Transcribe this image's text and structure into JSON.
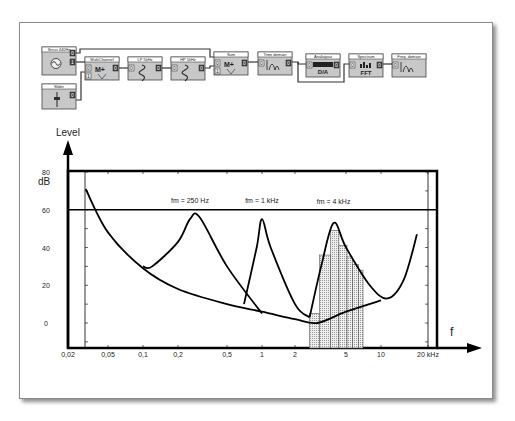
{
  "diagram": {
    "blocks": [
      {
        "id": "sine",
        "title": "Sinus 440Hz",
        "icon": "sine-generator-icon",
        "x": 42,
        "y": 47,
        "w": 34,
        "h": 28
      },
      {
        "id": "slider",
        "title": "Slider",
        "icon": "slider-icon",
        "x": 42,
        "y": 84,
        "w": 34,
        "h": 25
      },
      {
        "id": "multichannel",
        "title": "MultiChannel",
        "icon": "multiplier-icon",
        "x": 85,
        "y": 57,
        "w": 34,
        "h": 23
      },
      {
        "id": "lp",
        "title": "LP 5kHz",
        "icon": "lowpass-filter-icon",
        "x": 128,
        "y": 57,
        "w": 34,
        "h": 23
      },
      {
        "id": "hp",
        "title": "HP 1kHz",
        "icon": "highpass-filter-icon",
        "x": 171,
        "y": 57,
        "w": 34,
        "h": 23
      },
      {
        "id": "sum",
        "title": "Sum",
        "icon": "sum-icon",
        "x": 214,
        "y": 52,
        "w": 34,
        "h": 23
      },
      {
        "id": "time",
        "title": "Time domain",
        "icon": "time-domain-icon",
        "x": 258,
        "y": 52,
        "w": 34,
        "h": 23
      },
      {
        "id": "analog",
        "title": "Analogout",
        "icon": "da-converter-icon",
        "x": 306,
        "y": 54,
        "w": 34,
        "h": 23
      },
      {
        "id": "fft",
        "title": "Spectrum",
        "icon": "fft-icon",
        "x": 349,
        "y": 54,
        "w": 34,
        "h": 23
      },
      {
        "id": "freq",
        "title": "Freq. domain",
        "icon": "freq-domain-icon",
        "x": 392,
        "y": 54,
        "w": 34,
        "h": 23
      }
    ],
    "port_labels": {
      "in0": "0",
      "in1": "1",
      "out0": "0",
      "out1": "1",
      "da": "D/A",
      "fft": "FFT"
    }
  },
  "chart_data": {
    "type": "line",
    "title": "",
    "ylabel": "Level",
    "yunit": "dB",
    "xlabel": "f",
    "xunit": "kHz",
    "xscale": "log",
    "xlim": [
      0.02,
      20
    ],
    "ylim": [
      -10,
      80
    ],
    "y_ticks": [
      {
        "label": "80",
        "value": 80
      },
      {
        "label": "60",
        "value": 60
      },
      {
        "label": "40",
        "value": 40
      },
      {
        "label": "20",
        "value": 20
      },
      {
        "label": "0",
        "value": 0
      }
    ],
    "x_ticks": [
      {
        "label": "0,02",
        "value": 0.02
      },
      {
        "label": "0,05",
        "value": 0.05
      },
      {
        "label": "0,1",
        "value": 0.1
      },
      {
        "label": "0,2",
        "value": 0.2
      },
      {
        "label": "0,5",
        "value": 0.5
      },
      {
        "label": "1",
        "value": 1
      },
      {
        "label": "2",
        "value": 2
      },
      {
        "label": "5",
        "value": 5
      },
      {
        "label": "10",
        "value": 10
      },
      {
        "label": "20 kHz",
        "value": 20
      }
    ],
    "reference_line": {
      "value": 60,
      "label": ""
    },
    "annotations": [
      {
        "text": "fm = 250 Hz",
        "x": 0.25
      },
      {
        "text": "fm = 1 kHz",
        "x": 1
      },
      {
        "text": "fm = 4 kHz",
        "x": 4
      }
    ],
    "series": [
      {
        "name": "threshold-in-quiet",
        "points": [
          [
            0.03,
            71
          ],
          [
            0.05,
            48
          ],
          [
            0.1,
            29
          ],
          [
            0.2,
            18
          ],
          [
            0.5,
            10
          ],
          [
            1,
            6
          ],
          [
            2,
            2
          ],
          [
            3,
            0
          ],
          [
            5,
            6
          ],
          [
            10,
            12
          ]
        ]
      },
      {
        "name": "masking fm = 250 Hz",
        "points": [
          [
            0.1,
            30
          ],
          [
            0.12,
            30
          ],
          [
            0.2,
            43
          ],
          [
            0.25,
            55
          ],
          [
            0.3,
            56
          ],
          [
            0.5,
            30
          ],
          [
            1,
            5
          ]
        ]
      },
      {
        "name": "masking fm = 1 kHz",
        "points": [
          [
            0.7,
            10
          ],
          [
            0.9,
            40
          ],
          [
            1,
            55
          ],
          [
            1.2,
            40
          ],
          [
            2,
            10
          ],
          [
            2.6,
            3
          ]
        ]
      },
      {
        "name": "masking fm = 4 kHz",
        "points": [
          [
            2.6,
            3
          ],
          [
            3.2,
            30
          ],
          [
            4,
            53
          ],
          [
            5,
            40
          ],
          [
            8,
            20
          ],
          [
            11,
            13
          ],
          [
            14,
            23
          ],
          [
            17,
            47
          ]
        ]
      }
    ],
    "bars": {
      "name": "spectrum",
      "bins": [
        {
          "from": 2.6,
          "to": 3.1,
          "value": 5
        },
        {
          "from": 3.1,
          "to": 3.8,
          "value": 36
        },
        {
          "from": 3.8,
          "to": 4.4,
          "value": 49
        },
        {
          "from": 4.4,
          "to": 5.1,
          "value": 41
        },
        {
          "from": 5.1,
          "to": 5.7,
          "value": 35
        },
        {
          "from": 5.7,
          "to": 6.4,
          "value": 31
        },
        {
          "from": 6.4,
          "to": 7.0,
          "value": 28
        }
      ]
    },
    "grid": false,
    "legend": "none"
  }
}
